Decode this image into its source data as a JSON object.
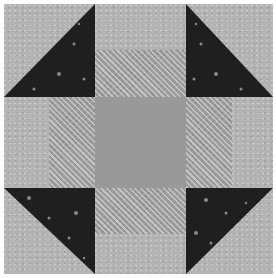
{
  "image": {
    "subject": "Quilt block (Churn Dash / Monkey Wrench pattern)",
    "grid": "3x3",
    "colors": {
      "light_print": "#b3b3b3",
      "textured_print": "#9c9c9c",
      "center_solid": "#999999",
      "dark_print": "#1f1f1f",
      "background": "#ffffff"
    },
    "pieces": [
      {
        "position": "top-left",
        "type": "half-square-triangle",
        "dark_side": "bottom-right"
      },
      {
        "position": "top-center",
        "type": "two-strip",
        "outer": "light",
        "inner": "textured"
      },
      {
        "position": "top-right",
        "type": "half-square-triangle",
        "dark_side": "bottom-left"
      },
      {
        "position": "middle-left",
        "type": "two-strip",
        "outer": "light",
        "inner": "textured"
      },
      {
        "position": "center",
        "type": "solid-square",
        "fabric": "center_solid"
      },
      {
        "position": "middle-right",
        "type": "two-strip",
        "outer": "light",
        "inner": "textured"
      },
      {
        "position": "bottom-left",
        "type": "half-square-triangle",
        "dark_side": "top-right"
      },
      {
        "position": "bottom-center",
        "type": "two-strip",
        "outer": "light",
        "inner": "textured"
      },
      {
        "position": "bottom-right",
        "type": "half-square-triangle",
        "dark_side": "top-left"
      }
    ]
  }
}
